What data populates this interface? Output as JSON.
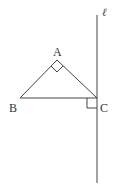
{
  "diagram": {
    "line": {
      "label": "ℓ",
      "x": 97,
      "y1": 15,
      "y2": 183
    },
    "points": [
      {
        "name": "A",
        "x": 57,
        "y": 60
      },
      {
        "name": "B",
        "x": 20,
        "y": 98
      },
      {
        "name": "C",
        "x": 97,
        "y": 98
      }
    ],
    "labels": {
      "A": "A",
      "B": "B",
      "C": "C",
      "l": "ℓ"
    },
    "right_angles": [
      "A",
      "C"
    ],
    "colors": {
      "stroke": "#444444",
      "background": "#ffffff"
    }
  }
}
